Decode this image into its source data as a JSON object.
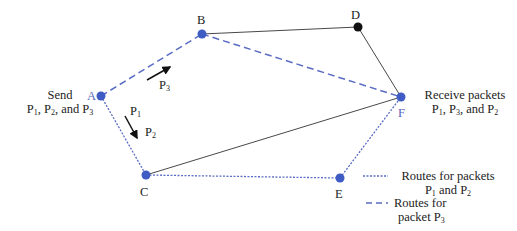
{
  "nodes": [
    {
      "id": "A",
      "x": 101,
      "y": 96,
      "color": "#3f5bc4"
    },
    {
      "id": "B",
      "x": 202,
      "y": 34,
      "color": "#3f5bc4"
    },
    {
      "id": "D",
      "x": 358,
      "y": 27,
      "color": "#111111"
    },
    {
      "id": "F",
      "x": 401,
      "y": 97,
      "color": "#3f5bc4"
    },
    {
      "id": "C",
      "x": 146,
      "y": 175,
      "color": "#3f5bc4"
    },
    {
      "id": "E",
      "x": 340,
      "y": 178,
      "color": "#3f5bc4"
    }
  ],
  "labels": {
    "A": "A",
    "B": "B",
    "C": "C",
    "D": "D",
    "E": "E",
    "F": "F"
  },
  "send": {
    "line1": "Send",
    "p1": "P",
    "s1": "1",
    "sep1": ", ",
    "p2": "P",
    "s2": "2",
    "sep2": ", and ",
    "p3": "P",
    "s3": "3"
  },
  "receive": {
    "line1": "Receive packets",
    "p1": "P",
    "s1": "1",
    "sep1": ", ",
    "p2": "P",
    "s2": "3",
    "sep2": ", and ",
    "p3": "P",
    "s3": "2"
  },
  "arrow_labels": {
    "p3": "P",
    "p3s": "3",
    "p1": "P",
    "p1s": "1",
    "p2": "P",
    "p2s": "2"
  },
  "legend": {
    "dotted_line1": "Routes for packets",
    "dotted_p1": "P",
    "dotted_s1": "1",
    "dotted_and": " and ",
    "dotted_p2": "P",
    "dotted_s2": "2",
    "dashed_line1": "Routes for",
    "dashed_line2": "packet ",
    "dashed_p": "P",
    "dashed_s": "3"
  },
  "colors": {
    "route": "#3f5bc4",
    "link": "#333333"
  }
}
